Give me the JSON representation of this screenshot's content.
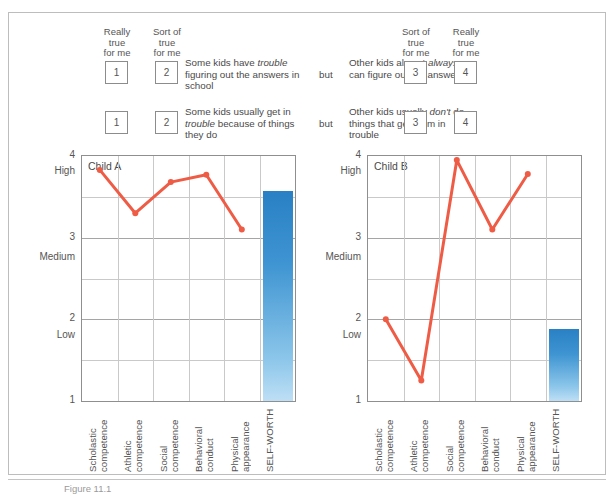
{
  "questionnaire": {
    "left_headers": [
      "Really\ntrue\nfor me",
      "Sort of\ntrue\nfor me"
    ],
    "right_headers": [
      "Sort of\ntrue\nfor me",
      "Really\ntrue\nfor me"
    ],
    "conjunction": "but",
    "items": [
      {
        "left_values": [
          "1",
          "2"
        ],
        "left_text_pre": "Some kids have ",
        "left_text_em": "trouble",
        "left_text_post": " figuring out the answers in school",
        "right_text_pre": "Other kids almost ",
        "right_text_em": "always",
        "right_text_post": " can figure out the answers",
        "right_values": [
          "3",
          "4"
        ]
      },
      {
        "left_values": [
          "1",
          "2"
        ],
        "left_text_pre": "Some kids usually get in ",
        "left_text_em": "trouble",
        "left_text_post": " because of things they do",
        "right_text_pre": "Other kids usually ",
        "right_text_em": "don't",
        "right_text_post": " do things that get them in trouble",
        "right_values": [
          "3",
          "4"
        ]
      }
    ]
  },
  "caption": "Figure 11.1",
  "colors": {
    "line": "#ef5c46",
    "bar_top": "#2980c4",
    "bar_bottom": "#bedff5",
    "grid_major": "#a5a5a5",
    "grid_minor": "#c9c9c9",
    "axis": "#8f8f8f"
  },
  "chart_data": [
    {
      "type": "line",
      "title": "Child A",
      "categories": [
        "Scholastic\ncompetence",
        "Athletic\ncompetence",
        "Social\ncompetence",
        "Behavioral\nconduct",
        "Physical\nappearance",
        "SELF-WORTH"
      ],
      "values": [
        3.83,
        3.3,
        3.68,
        3.77,
        3.1
      ],
      "bar_category": "SELF-WORTH",
      "bar_value": 3.57,
      "ylim": [
        1,
        4
      ],
      "yticks": [
        1,
        2,
        3,
        4
      ],
      "ytick_labels": [
        "1",
        "2",
        "3",
        "4"
      ],
      "y_band_labels": [
        {
          "label": "High",
          "value": 3.8
        },
        {
          "label": "Medium",
          "value": 2.75
        },
        {
          "label": "Low",
          "value": 1.8
        }
      ],
      "gridlines_minor": [
        1.5,
        2.5,
        3.5
      ],
      "xlabel": "",
      "ylabel": "",
      "grid": true,
      "legend": "none"
    },
    {
      "type": "line",
      "title": "Child B",
      "categories": [
        "Scholastic\ncompetence",
        "Athletic\ncompetence",
        "Social\ncompetence",
        "Behavioral\nconduct",
        "Physical\nappearance",
        "SELF-WORTH"
      ],
      "values": [
        2.0,
        1.25,
        3.95,
        3.1,
        3.78
      ],
      "bar_category": "SELF-WORTH",
      "bar_value": 1.88,
      "ylim": [
        1,
        4
      ],
      "yticks": [
        1,
        2,
        3,
        4
      ],
      "ytick_labels": [
        "1",
        "2",
        "3",
        "4"
      ],
      "y_band_labels": [
        {
          "label": "High",
          "value": 3.8
        },
        {
          "label": "Medium",
          "value": 2.75
        },
        {
          "label": "Low",
          "value": 1.8
        }
      ],
      "gridlines_minor": [
        1.5,
        2.5,
        3.5
      ],
      "xlabel": "",
      "ylabel": "",
      "grid": true,
      "legend": "none"
    }
  ]
}
